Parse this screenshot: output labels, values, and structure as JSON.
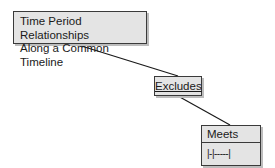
{
  "diagram": {
    "title": {
      "line1": "Time Period Relationships",
      "line2": "Along a Common Timeline"
    },
    "relation": {
      "label": "Excludes"
    },
    "entity": {
      "name": "Meets",
      "symbol": "|-|-----|"
    },
    "colors": {
      "box_fill": "#e4e4e4",
      "border": "#3a3a3a",
      "shadow": "#bdbdbd",
      "line": "#1a1a1a"
    }
  }
}
